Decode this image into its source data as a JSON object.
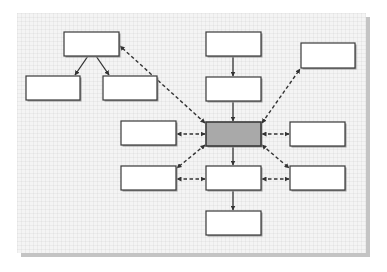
{
  "diagram": {
    "title": "",
    "colors": {
      "panel_bg": "#f4f4f4",
      "panel_shadow": "#c4c4c4",
      "box_fill": "#ffffff",
      "box_stroke": "#3a3a3a",
      "central_fill": "#a9a9a9",
      "line": "#333333"
    },
    "panel": {
      "x": 17,
      "y": 13,
      "w": 349,
      "h": 240
    },
    "nodes": [
      {
        "id": "A",
        "label": "",
        "x": 64,
        "y": 32,
        "w": 55,
        "h": 24,
        "central": false
      },
      {
        "id": "B",
        "label": "",
        "x": 26,
        "y": 76,
        "w": 54,
        "h": 24,
        "central": false
      },
      {
        "id": "C",
        "label": "",
        "x": 103,
        "y": 76,
        "w": 54,
        "h": 24,
        "central": false
      },
      {
        "id": "D",
        "label": "",
        "x": 206,
        "y": 32,
        "w": 55,
        "h": 24,
        "central": false
      },
      {
        "id": "E",
        "label": "",
        "x": 206,
        "y": 77,
        "w": 55,
        "h": 24,
        "central": false
      },
      {
        "id": "F",
        "label": "",
        "x": 301,
        "y": 43,
        "w": 54,
        "h": 25,
        "central": false
      },
      {
        "id": "G",
        "label": "",
        "x": 206,
        "y": 122,
        "w": 55,
        "h": 24,
        "central": true
      },
      {
        "id": "H",
        "label": "",
        "x": 121,
        "y": 121,
        "w": 55,
        "h": 24,
        "central": false
      },
      {
        "id": "I",
        "label": "",
        "x": 290,
        "y": 122,
        "w": 55,
        "h": 24,
        "central": false
      },
      {
        "id": "J",
        "label": "",
        "x": 121,
        "y": 166,
        "w": 55,
        "h": 24,
        "central": false
      },
      {
        "id": "K",
        "label": "",
        "x": 206,
        "y": 166,
        "w": 55,
        "h": 24,
        "central": false
      },
      {
        "id": "L",
        "label": "",
        "x": 290,
        "y": 166,
        "w": 55,
        "h": 24,
        "central": false
      },
      {
        "id": "M",
        "label": "",
        "x": 206,
        "y": 211,
        "w": 55,
        "h": 24,
        "central": false
      }
    ],
    "edges": [
      {
        "from": "A",
        "to": "B",
        "style": "solid",
        "arrows": "end",
        "x1": 88,
        "y1": 56,
        "x2": 75,
        "y2": 75
      },
      {
        "from": "A",
        "to": "C",
        "style": "solid",
        "arrows": "end",
        "x1": 96,
        "y1": 56,
        "x2": 109,
        "y2": 75
      },
      {
        "from": "D",
        "to": "E",
        "style": "solid",
        "arrows": "end",
        "x1": 233,
        "y1": 56,
        "x2": 233,
        "y2": 76
      },
      {
        "from": "E",
        "to": "G",
        "style": "solid",
        "arrows": "end",
        "x1": 233,
        "y1": 101,
        "x2": 233,
        "y2": 121
      },
      {
        "from": "G",
        "to": "K",
        "style": "solid",
        "arrows": "end",
        "x1": 233,
        "y1": 146,
        "x2": 233,
        "y2": 165
      },
      {
        "from": "K",
        "to": "M",
        "style": "solid",
        "arrows": "end",
        "x1": 233,
        "y1": 190,
        "x2": 233,
        "y2": 210
      },
      {
        "from": "G",
        "to": "A",
        "style": "dashed",
        "arrows": "both",
        "x1": 205,
        "y1": 123,
        "x2": 120,
        "y2": 46
      },
      {
        "from": "G",
        "to": "F",
        "style": "dashed",
        "arrows": "both",
        "x1": 262,
        "y1": 123,
        "x2": 300,
        "y2": 69
      },
      {
        "from": "G",
        "to": "H",
        "style": "dashed",
        "arrows": "both",
        "x1": 205,
        "y1": 134,
        "x2": 177,
        "y2": 134
      },
      {
        "from": "G",
        "to": "I",
        "style": "dashed",
        "arrows": "both",
        "x1": 262,
        "y1": 134,
        "x2": 289,
        "y2": 134
      },
      {
        "from": "G",
        "to": "J",
        "style": "dashed",
        "arrows": "both",
        "x1": 205,
        "y1": 145,
        "x2": 177,
        "y2": 168
      },
      {
        "from": "G",
        "to": "L",
        "style": "dashed",
        "arrows": "both",
        "x1": 262,
        "y1": 145,
        "x2": 289,
        "y2": 168
      },
      {
        "from": "K",
        "to": "J",
        "style": "dashed",
        "arrows": "both",
        "x1": 205,
        "y1": 179,
        "x2": 177,
        "y2": 179
      },
      {
        "from": "K",
        "to": "L",
        "style": "dashed",
        "arrows": "both",
        "x1": 262,
        "y1": 179,
        "x2": 289,
        "y2": 179
      }
    ]
  }
}
